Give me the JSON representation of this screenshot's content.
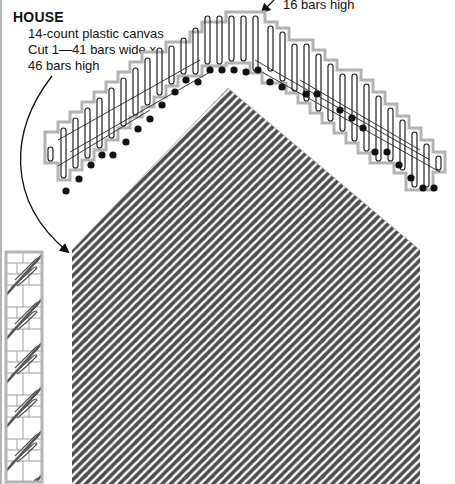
{
  "diagram": {
    "title": "HOUSE",
    "spec_lines": [
      "14-count plastic canvas",
      "Cut 1—41 bars wide x",
      "46 bars high"
    ],
    "roof_label": "16 bars high",
    "pieces": {
      "house": {
        "bars_wide": 41,
        "bars_high": 46,
        "stitch_color": "#4d4d4d"
      },
      "roof_strip": {
        "bars_high": 16,
        "outline_color": "#b3b3b3",
        "knot_color": "#111111"
      },
      "side_strip": {
        "outline_color": "#b3b3b3",
        "stitch_color": "#555555"
      }
    },
    "colors": {
      "canvas_outline": "#b3b3b3",
      "grid_line": "#333333",
      "stitch": "#4d4d4d",
      "text": "#111111"
    }
  }
}
